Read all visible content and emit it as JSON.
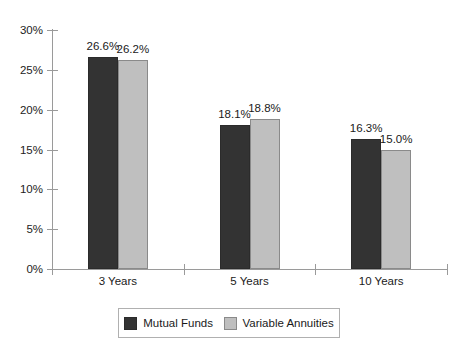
{
  "chart_data": {
    "type": "bar",
    "title": "",
    "subtitle": "",
    "xlabel": "",
    "ylabel": "",
    "categories": [
      "3 Years",
      "5 Years",
      "10 Years"
    ],
    "series": [
      {
        "name": "Mutual Funds",
        "color": "#333333",
        "values": [
          26.6,
          18.1,
          16.3
        ],
        "labels": [
          "26.6%",
          "18.1%",
          "16.3%"
        ]
      },
      {
        "name": "Variable Annuities",
        "color": "#bfbfbf",
        "values": [
          26.2,
          18.8,
          15.0
        ],
        "labels": [
          "26.2%",
          "18.8%",
          "15.0%"
        ]
      }
    ],
    "ylim": [
      0,
      30
    ],
    "ytick_step": 5,
    "ytick_labels": [
      "0%",
      "5%",
      "10%",
      "15%",
      "20%",
      "25%",
      "30%"
    ],
    "ytick_values": [
      0,
      5,
      10,
      15,
      20,
      25,
      30
    ],
    "grid": false,
    "legend_position": "bottom",
    "axis_color": "#9a9a9a",
    "text_color": "#1a1a1a",
    "background": "#ffffff"
  }
}
